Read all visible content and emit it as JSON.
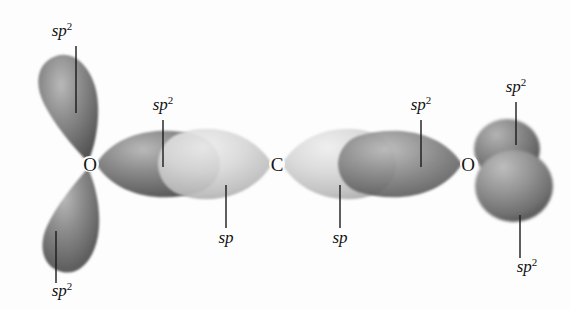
{
  "figure": {
    "background_color": "#fdfdfd",
    "ink_color": "#171717",
    "width": 570,
    "height": 310
  },
  "atoms": [
    {
      "id": "o-left",
      "symbol": "O",
      "x": 90,
      "y": 164
    },
    {
      "id": "c-center",
      "symbol": "C",
      "x": 277,
      "y": 164
    },
    {
      "id": "o-right",
      "symbol": "O",
      "x": 468,
      "y": 164
    }
  ],
  "orbital_labels": [
    {
      "id": "label-sp2-upper-left",
      "base": "sp",
      "superscript": "2",
      "text": "sp2",
      "x": 62,
      "y": 36,
      "leader": {
        "x1": 76,
        "y1": 46,
        "x2": 76,
        "y2": 113
      }
    },
    {
      "id": "label-sp2-o-left-bond",
      "base": "sp",
      "superscript": "2",
      "text": "sp2",
      "x": 163,
      "y": 110,
      "leader": {
        "x1": 163,
        "y1": 120,
        "x2": 163,
        "y2": 167
      }
    },
    {
      "id": "label-sp-left",
      "base": "sp",
      "superscript": "",
      "text": "sp",
      "x": 226,
      "y": 243,
      "leader": {
        "x1": 226,
        "y1": 228,
        "x2": 226,
        "y2": 185
      }
    },
    {
      "id": "label-sp-right",
      "base": "sp",
      "superscript": "",
      "text": "sp",
      "x": 340,
      "y": 243,
      "leader": {
        "x1": 340,
        "y1": 228,
        "x2": 340,
        "y2": 185
      }
    },
    {
      "id": "label-sp2-o-right-bond",
      "base": "sp",
      "superscript": "2",
      "text": "sp2",
      "x": 421,
      "y": 110,
      "leader": {
        "x1": 421,
        "y1": 120,
        "x2": 421,
        "y2": 167
      }
    },
    {
      "id": "label-sp2-upper-right",
      "base": "sp",
      "superscript": "2",
      "text": "sp2",
      "x": 516,
      "y": 92,
      "leader": {
        "x1": 516,
        "y1": 102,
        "x2": 516,
        "y2": 145
      }
    },
    {
      "id": "label-sp2-lower-right",
      "base": "sp",
      "superscript": "2",
      "text": "sp2",
      "x": 527,
      "y": 272,
      "leader": {
        "x1": 520,
        "y1": 258,
        "x2": 520,
        "y2": 215
      }
    },
    {
      "id": "label-sp2-lower-left",
      "base": "sp",
      "superscript": "2",
      "text": "sp2",
      "x": 62,
      "y": 296,
      "leader": {
        "x1": 56,
        "y1": 283,
        "x2": 56,
        "y2": 231
      }
    }
  ],
  "lobes": [
    {
      "id": "lobe-o-left-upper",
      "kind": "sp2",
      "shade": "dark"
    },
    {
      "id": "lobe-o-left-lower",
      "kind": "sp2",
      "shade": "dark"
    },
    {
      "id": "lobe-o-left-bond",
      "kind": "sp2",
      "shade": "dark"
    },
    {
      "id": "lobe-c-left-bond",
      "kind": "sp",
      "shade": "light"
    },
    {
      "id": "lobe-c-right-bond",
      "kind": "sp",
      "shade": "light"
    },
    {
      "id": "lobe-o-right-bond",
      "kind": "sp2",
      "shade": "dark"
    },
    {
      "id": "lobe-o-right-upper",
      "kind": "sp2",
      "shade": "dark"
    },
    {
      "id": "lobe-o-right-lower",
      "kind": "sp2",
      "shade": "dark"
    }
  ],
  "legend": {
    "dark_lobe_color": "#6f6f6f",
    "light_lobe_color": "#c9c9c9"
  }
}
